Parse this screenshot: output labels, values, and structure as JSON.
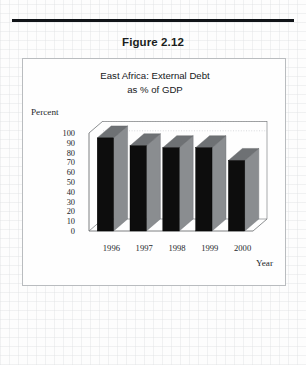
{
  "document": {
    "figure_caption": "Figure 2.12"
  },
  "chart_data": {
    "type": "bar",
    "title": "East Africa: External Debt as % of GDP",
    "title_lines": [
      "East Africa: External Debt",
      "as % of GDP"
    ],
    "xlabel": "Year",
    "ylabel": "Percent",
    "categories": [
      "1996",
      "1997",
      "1998",
      "1999",
      "2000"
    ],
    "values": [
      95,
      87,
      85,
      85,
      72
    ],
    "ylim": [
      0,
      100
    ],
    "ytick_labels": [
      "100",
      "90",
      "80",
      "70",
      "60",
      "50",
      "40",
      "30",
      "20",
      "10",
      "0"
    ],
    "ytick_values": [
      100,
      90,
      80,
      70,
      60,
      50,
      40,
      30,
      20,
      10,
      0
    ],
    "grid": true,
    "legend": false,
    "style": "3d-column",
    "colors": {
      "bar_front": "#0d0d0d",
      "bar_side": "#8a8d90",
      "bar_top": "#6e7174",
      "grid": "#c9ccd0",
      "axis": "#6f7275",
      "plot_background": "#fefefe",
      "frame_border": "#b9bcbf",
      "text": "#1a1d20",
      "rule": "#111418"
    }
  }
}
